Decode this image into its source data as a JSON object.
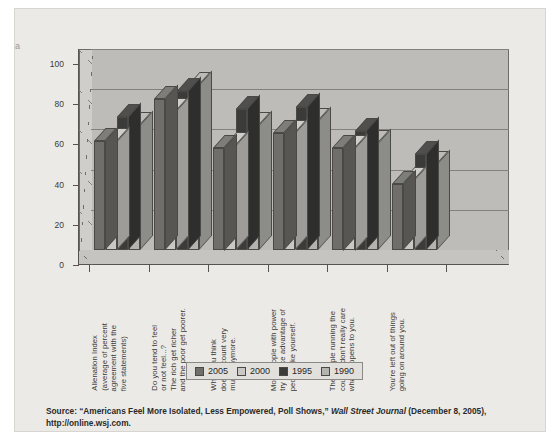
{
  "margin_mark": "a",
  "chart_data": {
    "type": "bar",
    "title": "",
    "xlabel": "",
    "ylabel": "",
    "ylim": [
      0,
      100
    ],
    "yticks": [
      0,
      20,
      40,
      60,
      80,
      100
    ],
    "grid": true,
    "legend_position": "bottom",
    "categories": [
      "Alienation Index\n(average of percent\nagreement with the\nfive statements)",
      "Do you tend to feel\nor not feel...?\nThe rich get richer\nand the poor get poorer.",
      "What you think\ndoesn't count very\nmuch anymore.",
      "Most people with power\ntry to take advantage of\npeople like yourself.",
      "The people running the\ncountry don't really care\nwhat happens to you.",
      "You're left out of things\ngoing on around you."
    ],
    "category_lines": [
      [
        "Alienation Index",
        "(average of percent",
        "agreement with the",
        "five statements)"
      ],
      [
        "Do you tend to feel",
        "or not feel...?",
        "The rich get richer",
        "and the poor get poorer."
      ],
      [
        "What you think",
        "doesn't count very",
        "much anymore."
      ],
      [
        "Most people with power",
        "try to take advantage of",
        "people like yourself."
      ],
      [
        "The people running the",
        "country don't really care",
        "what happens to you."
      ],
      [
        "You're left out of things",
        "going on around you."
      ]
    ],
    "series": [
      {
        "name": "2005",
        "color": "#6f6e6a",
        "values": [
          54,
          75,
          51,
          58,
          51,
          33
        ]
      },
      {
        "name": "2000",
        "color": "#c9c8c4",
        "values": [
          54,
          69,
          52,
          58,
          51,
          35
        ]
      },
      {
        "name": "1995",
        "color": "#3b3b3a",
        "values": [
          66,
          79,
          70,
          71,
          59,
          48
        ]
      },
      {
        "name": "1990",
        "color": "#b4b3af",
        "values": [
          62,
          82,
          62,
          64,
          53,
          43
        ]
      }
    ]
  },
  "legend": {
    "items": [
      {
        "label": "2005",
        "color": "#6f6e6a"
      },
      {
        "label": "2000",
        "color": "#c9c8c4"
      },
      {
        "label": "1995",
        "color": "#3b3b3a"
      },
      {
        "label": "1990",
        "color": "#b4b3af"
      }
    ]
  },
  "source": {
    "prefix": "Source: “Americans Feel More Isolated, Less Empowered, Poll Shows,” ",
    "italic": "Wall Street Journal",
    "suffix": " (December 8, 2005), http://online.wsj.com."
  },
  "colors": {
    "panel_bg": "#eceae6",
    "plot_bg": "#bdbcb8",
    "axis": "#55544f",
    "grid": "#83817d"
  }
}
